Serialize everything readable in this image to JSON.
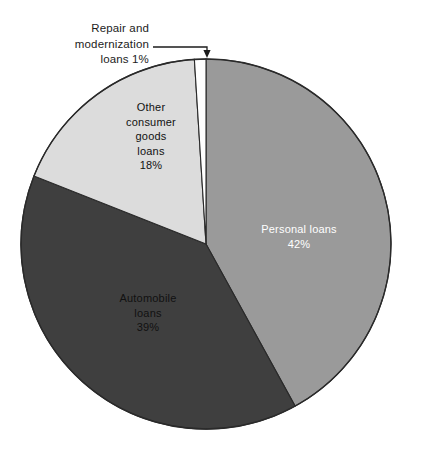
{
  "chart_data": {
    "type": "pie",
    "title": "",
    "subtitle": "",
    "xlabel": "",
    "ylabel": "",
    "legend_position": "none",
    "grid": false,
    "units": "percent",
    "categories": [
      "Personal loans",
      "Automobile loans",
      "Other consumer goods loans",
      "Repair and modernization loans"
    ],
    "values": [
      42,
      39,
      18,
      1
    ],
    "slices": [
      {
        "name": "personal-loans",
        "label_lines": [
          "Personal loans",
          "42%"
        ],
        "value": 42,
        "value_text": "42%",
        "color": "#9a9a9a",
        "text_color": "#ffffff",
        "label_placement": "inside",
        "start_angle_deg": 0,
        "end_angle_deg": 151.2,
        "label_x": 299,
        "label_y": 236
      },
      {
        "name": "automobile-loans",
        "label_lines": [
          "Automobile",
          "loans",
          "39%"
        ],
        "value": 39,
        "value_text": "39%",
        "color": "#3f3f3f",
        "text_color": "#111111",
        "label_placement": "inside",
        "start_angle_deg": 151.2,
        "end_angle_deg": 291.6,
        "label_x": 148,
        "label_y": 313
      },
      {
        "name": "other-consumer-goods-loans",
        "label_lines": [
          "Other",
          "consumer",
          "goods",
          "loans",
          "18%"
        ],
        "value": 18,
        "value_text": "18%",
        "color": "#dcdcdc",
        "text_color": "#111111",
        "label_placement": "inside",
        "start_angle_deg": 291.6,
        "end_angle_deg": 356.4,
        "label_x": 151,
        "label_y": 136
      },
      {
        "name": "repair-and-modernization-loans",
        "label_lines": [
          "Repair and",
          "modernization",
          "loans 1%"
        ],
        "value": 1,
        "value_text": "1%",
        "color": "#ffffff",
        "text_color": "#1c1c1c",
        "label_placement": "callout",
        "start_angle_deg": 356.4,
        "end_angle_deg": 360,
        "label_x": 62,
        "label_y": 28
      }
    ],
    "callout": {
      "name": "repair-and-modernization-callout",
      "lines": [
        "Repair and",
        "modernization",
        "loans 1%"
      ],
      "leader_from_x": 153,
      "leader_from_y": 47,
      "leader_to_x": 207,
      "leader_to_y": 58,
      "arrow": "down"
    },
    "geometry": {
      "center_x": 206,
      "center_y": 244,
      "radius": 185,
      "rotation_deg": 0,
      "outline_color": "#2a2a2a"
    }
  }
}
